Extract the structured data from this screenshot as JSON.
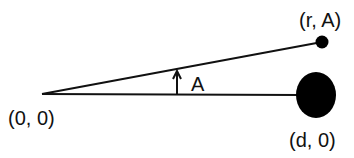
{
  "diagram": {
    "labels": {
      "origin": "(0, 0)",
      "moon_point": "(r, A)",
      "earth_point": "(d, 0)",
      "angle": "A"
    },
    "colors": {
      "stroke": "#111111",
      "fill": "#000000",
      "background": "#ffffff"
    }
  }
}
